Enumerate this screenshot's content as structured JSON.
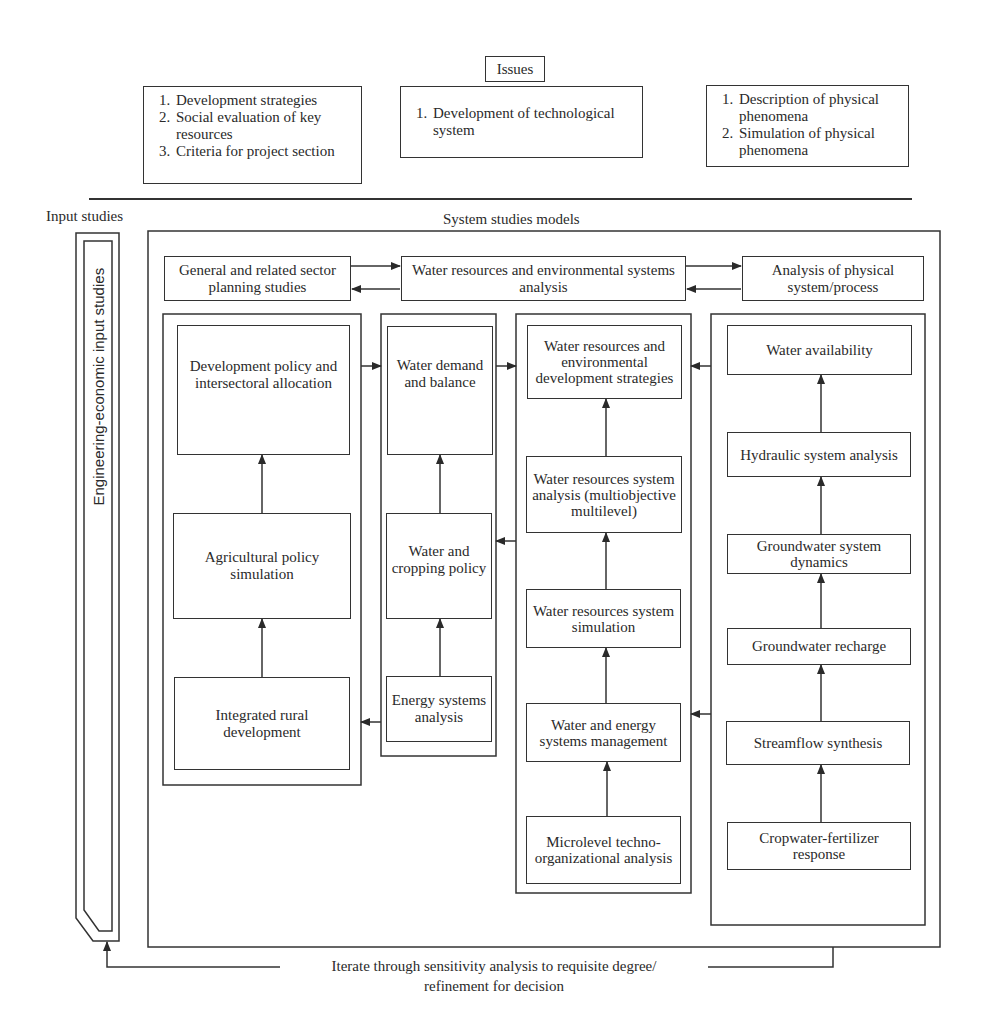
{
  "issues": {
    "title": "Issues",
    "left": [
      "Development strategies",
      "Social evaluation of key resources",
      "Criteria for project section"
    ],
    "center": [
      "Development of technological system"
    ],
    "right": [
      "Description of physical phenomena",
      "Simulation of physical phenomena"
    ]
  },
  "sections": {
    "input_studies": "Input studies",
    "system_studies_models": "System studies models",
    "engineering_bar": "Engineering-economic input studies"
  },
  "top_row": {
    "general": "General and related sector planning studies",
    "water_env": "Water resources and environmental systems analysis",
    "physical": "Analysis of physical system/process"
  },
  "columns": {
    "col1": [
      "Development policy and intersectoral allocation",
      "Agricultural policy simulation",
      "Integrated rural development"
    ],
    "col2": [
      "Water demand and balance",
      "Water and cropping policy",
      "Energy systems analysis"
    ],
    "col3": [
      "Water resources and environmental development strategies",
      "Water resources system analysis (multiobjective multilevel)",
      "Water resources system simulation",
      "Water and energy systems management",
      "Microlevel techno-organizational analysis"
    ],
    "col4": [
      "Water availability",
      "Hydraulic system analysis",
      "Groundwater system dynamics",
      "Groundwater recharge",
      "Streamflow synthesis",
      "Cropwater-fertilizer response"
    ]
  },
  "feedback": {
    "line1": "Iterate through sensitivity analysis to requisite degree/",
    "line2": "refinement for decision"
  },
  "colors": {
    "line": "#333333",
    "text": "#2a2a2a",
    "background": "#ffffff"
  }
}
